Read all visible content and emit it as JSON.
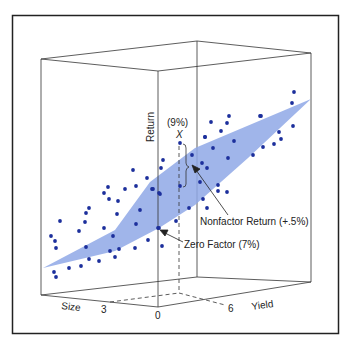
{
  "chart_data": {
    "type": "scatter",
    "subtype": "3d-scatter-with-regression-plane",
    "title": "",
    "axes": {
      "x": {
        "label": "Size",
        "ticks": [
          "3"
        ]
      },
      "y": {
        "label": "Yield",
        "ticks": [
          "6"
        ]
      },
      "z": {
        "label": "Return"
      },
      "origin_label": "0"
    },
    "annotations": [
      {
        "id": "x-point",
        "label": "X",
        "value_label": "(9%)"
      },
      {
        "id": "nonfactor",
        "label": "Nonfactor Return (+.5%)"
      },
      {
        "id": "zero-factor",
        "label": "Zero Factor (7%)"
      }
    ],
    "plane": {
      "color": "#8fa8e6",
      "description": "fitted regression plane"
    },
    "point_color": "#1c2f9c",
    "grid": false,
    "legend": null,
    "points_screen": [
      [
        133,
        170
      ],
      [
        147,
        178
      ],
      [
        108,
        187
      ],
      [
        104,
        193
      ],
      [
        125,
        189
      ],
      [
        136,
        186
      ],
      [
        152,
        189
      ],
      [
        159,
        193
      ],
      [
        109,
        199
      ],
      [
        118,
        201
      ],
      [
        89,
        208
      ],
      [
        86,
        213
      ],
      [
        85,
        222
      ],
      [
        60,
        221
      ],
      [
        79,
        231
      ],
      [
        117,
        214
      ],
      [
        140,
        210
      ],
      [
        136,
        224
      ],
      [
        104,
        228
      ],
      [
        113,
        236
      ],
      [
        51,
        236
      ],
      [
        55,
        241
      ],
      [
        56,
        248
      ],
      [
        86,
        247
      ],
      [
        110,
        251
      ],
      [
        119,
        249
      ],
      [
        135,
        248
      ],
      [
        148,
        240
      ],
      [
        158,
        228
      ],
      [
        89,
        259
      ],
      [
        99,
        261
      ],
      [
        115,
        257
      ],
      [
        81,
        266
      ],
      [
        69,
        268
      ],
      [
        54,
        272
      ],
      [
        56,
        277
      ],
      [
        180,
        143
      ],
      [
        205,
        137
      ],
      [
        213,
        148
      ],
      [
        234,
        141
      ],
      [
        228,
        158
      ],
      [
        192,
        155
      ],
      [
        202,
        163
      ],
      [
        207,
        168
      ],
      [
        253,
        155
      ],
      [
        163,
        160
      ],
      [
        161,
        168
      ],
      [
        200,
        182
      ],
      [
        180,
        186
      ],
      [
        218,
        185
      ],
      [
        218,
        191
      ],
      [
        227,
        192
      ],
      [
        153,
        189
      ],
      [
        160,
        194
      ],
      [
        203,
        199
      ],
      [
        189,
        208
      ],
      [
        207,
        208
      ],
      [
        176,
        221
      ],
      [
        159,
        228
      ],
      [
        162,
        246
      ],
      [
        294,
        92
      ],
      [
        292,
        103
      ],
      [
        261,
        116
      ],
      [
        293,
        126
      ],
      [
        279,
        132
      ],
      [
        281,
        139
      ],
      [
        274,
        144
      ],
      [
        263,
        147
      ],
      [
        211,
        122
      ],
      [
        229,
        116
      ],
      [
        227,
        123
      ],
      [
        221,
        131
      ],
      [
        205,
        137
      ],
      [
        260,
        116
      ]
    ]
  },
  "labels": {
    "z_axis": "Return",
    "x_axis": "Size",
    "y_axis": "Yield",
    "tick_3": "3",
    "tick_0": "0",
    "tick_6": "6",
    "x_point_value": "(9%)",
    "x_point_label": "X",
    "nonfactor": "Nonfactor Return (+.5%)",
    "zero_factor": "Zero Factor (7%)"
  }
}
